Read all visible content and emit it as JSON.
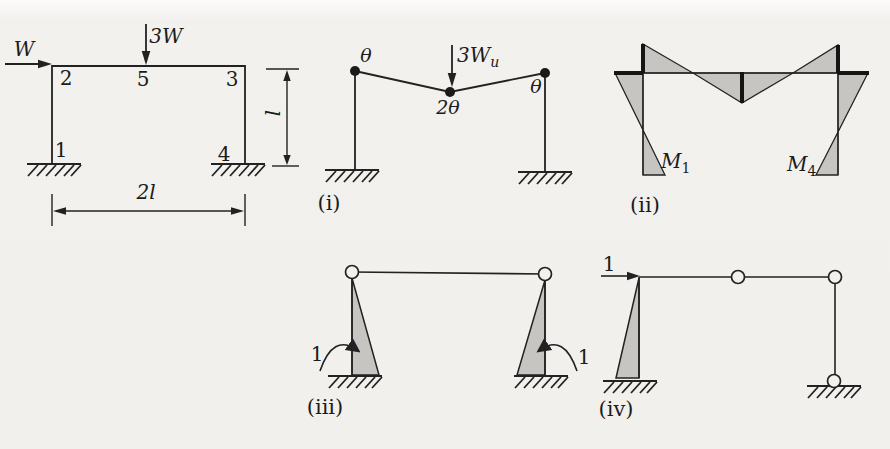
{
  "figure": {
    "frame": {
      "load_horizontal": "W",
      "load_vertical": "3W",
      "node_top_left": "2",
      "node_top_mid": "5",
      "node_top_right": "3",
      "node_bottom_left": "1",
      "node_bottom_right": "4",
      "dim_height": "l",
      "dim_span": "2l"
    },
    "mechanism": {
      "caption": "(i)",
      "load_main": "3W",
      "load_sub": "u",
      "theta_left": "θ",
      "theta_mid": "2θ",
      "theta_right": "θ"
    },
    "moment_diagram": {
      "caption": "(ii)",
      "m1_main": "M",
      "m1_sub": "1",
      "m4_main": "M",
      "m4_sub": "4"
    },
    "unit_rotation": {
      "caption": "(iii)",
      "left_label": "1",
      "right_label": "1"
    },
    "unit_load": {
      "caption": "(iv)",
      "label": "1"
    }
  },
  "colors": {
    "background": "#f2f1ee",
    "line": "#222222",
    "shade": "#c6c5c2"
  }
}
